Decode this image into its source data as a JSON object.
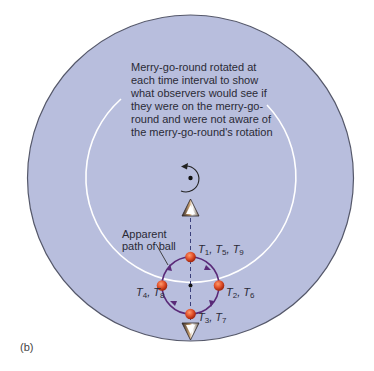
{
  "diagram": {
    "panel_label": "(b)",
    "caption_lines": [
      "Merry-go-round rotated at",
      "each time interval to show",
      "what observers would see if",
      "they were on the merry-go-",
      "round and were not aware of",
      "the merry-go-round's rotation"
    ],
    "path_label_lines": [
      "Apparent",
      "path of ball"
    ],
    "time_labels": {
      "top": {
        "t": "T",
        "subs": [
          "1",
          "5",
          "9"
        ]
      },
      "right": {
        "t": "T",
        "subs": [
          "2",
          "6"
        ]
      },
      "bottom": {
        "t": "T",
        "subs": [
          "3",
          "7"
        ]
      },
      "left": {
        "t": "T",
        "subs": [
          "4",
          "8"
        ]
      }
    },
    "elements": {
      "merry_go_round": "large-disc",
      "rotation_indicator": "counterclockwise-arrow-icon",
      "observers": [
        "observer-top-cone-icon",
        "observer-bottom-cone-icon"
      ],
      "ball_positions": 4,
      "path_direction": "clockwise"
    },
    "colors": {
      "disc_fill": "#b8bedd",
      "disc_edge": "#55586a",
      "inner_arc": "#ffffff",
      "path": "#5a2a78",
      "ball": "#e0502a",
      "dashed_line": "#3a3f7a",
      "text": "#2a2a36"
    }
  }
}
